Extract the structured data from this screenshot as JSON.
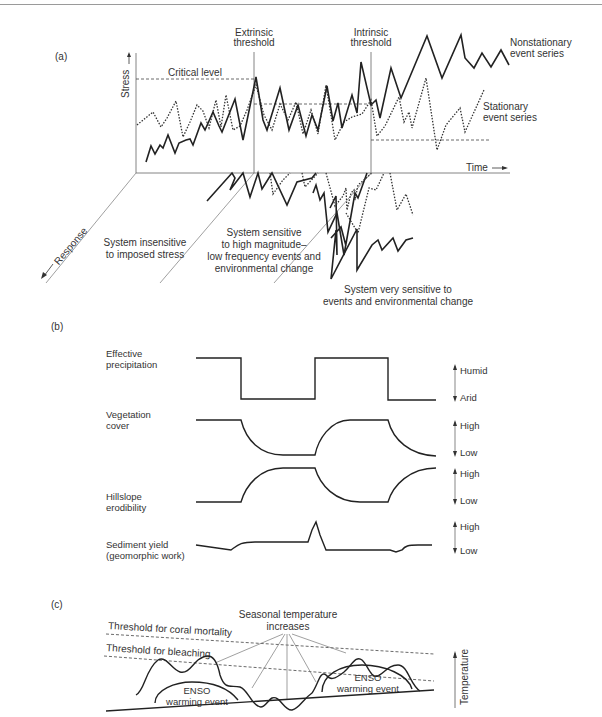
{
  "panel_a": {
    "label": "(a)",
    "y_axis_label": "Stress",
    "x_axis_label": "Time",
    "depth_axis_label": "Response",
    "critical_level": "Critical level",
    "extrinsic_threshold": [
      "Extrinsic",
      "threshold"
    ],
    "intrinsic_threshold": [
      "Intrinsic",
      "threshold"
    ],
    "nonstationary": [
      "Nonstationary",
      "event series"
    ],
    "stationary": [
      "Stationary",
      "event series"
    ],
    "zone1": [
      "System insensitive",
      "to imposed stress"
    ],
    "zone2": [
      "System sensitive",
      "to high magnitude–",
      "low frequency events and",
      "environmental change"
    ],
    "zone3": [
      "System very sensitive to",
      "events and environmental change"
    ]
  },
  "panel_b": {
    "label": "(b)",
    "rows": [
      {
        "label": [
          "Effective",
          "precipitation"
        ],
        "top": "Humid",
        "bottom": "Arid"
      },
      {
        "label": [
          "Vegetation",
          "cover"
        ],
        "top": "High",
        "bottom": "Low"
      },
      {
        "label": [
          "Hillslope",
          "erodibility"
        ],
        "top": "High",
        "bottom": "Low"
      },
      {
        "label": [
          "Sediment yield",
          "(geomorphic work)"
        ],
        "top": "High",
        "bottom": "Low"
      }
    ]
  },
  "panel_c": {
    "label": "(c)",
    "seasonal": [
      "Seasonal temperature",
      "increases"
    ],
    "coral_mortality": "Threshold for coral mortality",
    "bleaching": "Threshold for bleaching",
    "enso": [
      "ENSO",
      "warming event"
    ],
    "y_axis_label": "Temperature"
  }
}
